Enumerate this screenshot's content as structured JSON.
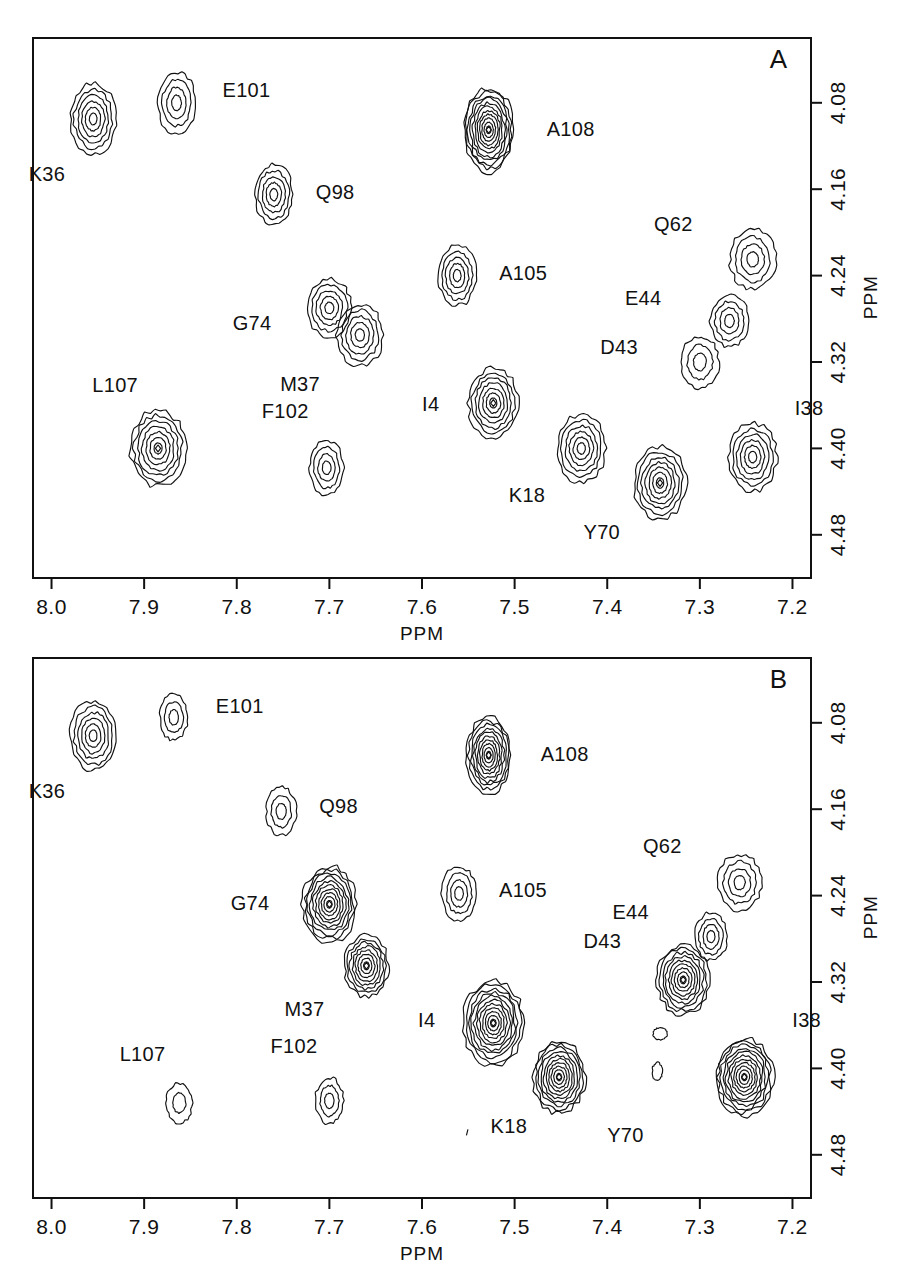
{
  "figure": {
    "caption": "",
    "panels": [
      {
        "id": "A",
        "letter": "A",
        "x_axis": {
          "label": "PPM",
          "ticks": [
            "8.0",
            "7.9",
            "7.8",
            "7.7",
            "7.6",
            "7.5",
            "7.4",
            "7.3",
            "7.2"
          ],
          "min": 7.2,
          "max": 8.0
        },
        "y_axis": {
          "label": "PPM",
          "ticks": [
            "4.08",
            "4.16",
            "4.24",
            "4.32",
            "4.40",
            "4.48"
          ],
          "min": 4.02,
          "max": 4.52
        }
      },
      {
        "id": "B",
        "letter": "B",
        "x_axis": {
          "label": "PPM",
          "ticks": [
            "8.0",
            "7.9",
            "7.8",
            "7.7",
            "7.6",
            "7.5",
            "7.4",
            "7.3",
            "7.2"
          ],
          "min": 7.2,
          "max": 8.0
        },
        "y_axis": {
          "label": "PPM",
          "ticks": [
            "4.08",
            "4.16",
            "4.24",
            "4.32",
            "4.40",
            "4.48"
          ],
          "min": 4.02,
          "max": 4.52
        }
      }
    ]
  },
  "chart_data": [
    {
      "type": "contour",
      "panel": "A",
      "title": "A",
      "xlabel": "PPM",
      "ylabel": "PPM",
      "xlim": [
        8.02,
        7.18
      ],
      "ylim": [
        4.02,
        4.52
      ],
      "xticks": [
        8.0,
        7.9,
        7.8,
        7.7,
        7.6,
        7.5,
        7.4,
        7.3,
        7.2
      ],
      "yticks": [
        4.08,
        4.16,
        4.24,
        4.32,
        4.4,
        4.48
      ],
      "grid": false,
      "legend": "none",
      "peaks": [
        {
          "label": "K36",
          "x": 7.955,
          "y": 4.095,
          "rx": 23,
          "ry": 35,
          "levels": 6,
          "label_dx": -28,
          "label_dy": 62,
          "intensity": "medium"
        },
        {
          "label": "E101",
          "x": 7.865,
          "y": 4.08,
          "rx": 19,
          "ry": 31,
          "levels": 4,
          "label_dx": 46,
          "label_dy": -6,
          "intensity": "low"
        },
        {
          "label": "A108",
          "x": 7.528,
          "y": 4.105,
          "rx": 25,
          "ry": 42,
          "levels": 11,
          "label_dx": 58,
          "label_dy": 6,
          "intensity": "very-high"
        },
        {
          "label": "Q98",
          "x": 7.76,
          "y": 4.165,
          "rx": 19,
          "ry": 30,
          "levels": 5,
          "label_dx": 42,
          "label_dy": 4,
          "intensity": "medium"
        },
        {
          "label": "Q62",
          "x": 7.243,
          "y": 4.225,
          "rx": 23,
          "ry": 30,
          "levels": 4,
          "label_dx": -60,
          "label_dy": -28,
          "intensity": "medium"
        },
        {
          "label": "A105",
          "x": 7.562,
          "y": 4.24,
          "rx": 19,
          "ry": 30,
          "levels": 5,
          "label_dx": 42,
          "label_dy": 4,
          "intensity": "medium"
        },
        {
          "label": "E44",
          "x": 7.268,
          "y": 4.282,
          "rx": 19,
          "ry": 26,
          "levels": 4,
          "label_dx": -68,
          "label_dy": -16,
          "intensity": "medium"
        },
        {
          "label": "G74",
          "x": 7.7,
          "y": 4.27,
          "rx": 22,
          "ry": 29,
          "levels": 5,
          "label_dx": -58,
          "label_dy": 22,
          "intensity": "medium"
        },
        {
          "label": "M37",
          "x": 7.667,
          "y": 4.295,
          "rx": 23,
          "ry": 31,
          "levels": 5,
          "label_dx": -40,
          "label_dy": 56,
          "intensity": "medium"
        },
        {
          "label": "D43",
          "x": 7.3,
          "y": 4.32,
          "rx": 19,
          "ry": 26,
          "levels": 3,
          "label_dx": -62,
          "label_dy": -8,
          "intensity": "low"
        },
        {
          "label": "I4",
          "x": 7.523,
          "y": 4.358,
          "rx": 25,
          "ry": 35,
          "levels": 7,
          "label_dx": -54,
          "label_dy": 8,
          "intensity": "high"
        },
        {
          "label": "L107",
          "x": 7.885,
          "y": 4.4,
          "rx": 28,
          "ry": 38,
          "levels": 7,
          "label_dx": -20,
          "label_dy": -56,
          "intensity": "high"
        },
        {
          "label": "F102",
          "x": 7.703,
          "y": 4.418,
          "rx": 17,
          "ry": 27,
          "levels": 4,
          "label_dx": -18,
          "label_dy": -50,
          "intensity": "low"
        },
        {
          "label": "K18",
          "x": 7.428,
          "y": 4.4,
          "rx": 24,
          "ry": 34,
          "levels": 6,
          "label_dx": -36,
          "label_dy": 54,
          "intensity": "medium"
        },
        {
          "label": "I38",
          "x": 7.243,
          "y": 4.408,
          "rx": 24,
          "ry": 34,
          "levels": 6,
          "label_dx": 42,
          "label_dy": -42,
          "intensity": "medium"
        },
        {
          "label": "Y70",
          "x": 7.343,
          "y": 4.432,
          "rx": 26,
          "ry": 36,
          "levels": 7,
          "label_dx": -40,
          "label_dy": 56,
          "intensity": "high"
        }
      ]
    },
    {
      "type": "contour",
      "panel": "B",
      "title": "B",
      "xlabel": "PPM",
      "ylabel": "PPM",
      "xlim": [
        8.02,
        7.18
      ],
      "ylim": [
        4.02,
        4.52
      ],
      "xticks": [
        8.0,
        7.9,
        7.8,
        7.7,
        7.6,
        7.5,
        7.4,
        7.3,
        7.2
      ],
      "yticks": [
        4.08,
        4.16,
        4.24,
        4.32,
        4.4,
        4.48
      ],
      "grid": false,
      "legend": "none",
      "peaks": [
        {
          "label": "K36",
          "x": 7.955,
          "y": 4.092,
          "rx": 23,
          "ry": 35,
          "levels": 6,
          "label_dx": -28,
          "label_dy": 62,
          "intensity": "medium"
        },
        {
          "label": "E101",
          "x": 7.868,
          "y": 4.075,
          "rx": 14,
          "ry": 23,
          "levels": 3,
          "label_dx": 42,
          "label_dy": -4,
          "intensity": "low"
        },
        {
          "label": "A108",
          "x": 7.528,
          "y": 4.11,
          "rx": 22,
          "ry": 38,
          "levels": 10,
          "label_dx": 52,
          "label_dy": 6,
          "intensity": "very-high"
        },
        {
          "label": "Q98",
          "x": 7.752,
          "y": 4.162,
          "rx": 15,
          "ry": 24,
          "levels": 3,
          "label_dx": 38,
          "label_dy": 2,
          "intensity": "low"
        },
        {
          "label": "Q62",
          "x": 7.257,
          "y": 4.228,
          "rx": 22,
          "ry": 28,
          "levels": 4,
          "label_dx": -58,
          "label_dy": -30,
          "intensity": "medium"
        },
        {
          "label": "A105",
          "x": 7.56,
          "y": 4.238,
          "rx": 17,
          "ry": 27,
          "levels": 4,
          "label_dx": 40,
          "label_dy": 4,
          "intensity": "low"
        },
        {
          "label": "E44",
          "x": 7.288,
          "y": 4.278,
          "rx": 16,
          "ry": 24,
          "levels": 4,
          "label_dx": -62,
          "label_dy": -18,
          "intensity": "medium"
        },
        {
          "label": "G74",
          "x": 7.7,
          "y": 4.248,
          "rx": 27,
          "ry": 38,
          "levels": 10,
          "label_dx": -60,
          "label_dy": 6,
          "intensity": "very-high"
        },
        {
          "label": "M37",
          "x": 7.66,
          "y": 4.305,
          "rx": 22,
          "ry": 31,
          "levels": 8,
          "label_dx": -42,
          "label_dy": 50,
          "intensity": "high"
        },
        {
          "label": "D43",
          "x": 7.318,
          "y": 4.318,
          "rx": 26,
          "ry": 35,
          "levels": 9,
          "label_dx": -62,
          "label_dy": -32,
          "intensity": "very-high"
        },
        {
          "label": "I4",
          "x": 7.523,
          "y": 4.358,
          "rx": 30,
          "ry": 42,
          "levels": 11,
          "label_dx": -58,
          "label_dy": 4,
          "intensity": "very-high"
        },
        {
          "label": "L107",
          "x": 7.862,
          "y": 4.432,
          "rx": 13,
          "ry": 20,
          "levels": 2,
          "label_dx": -14,
          "label_dy": -42,
          "intensity": "very-low"
        },
        {
          "label": "F102",
          "x": 7.7,
          "y": 4.43,
          "rx": 14,
          "ry": 23,
          "levels": 3,
          "label_dx": -12,
          "label_dy": -48,
          "intensity": "low"
        },
        {
          "label": "K18",
          "x": 7.452,
          "y": 4.408,
          "rx": 26,
          "ry": 36,
          "levels": 10,
          "label_dx": -32,
          "label_dy": 56,
          "intensity": "very-high"
        },
        {
          "label": "I38",
          "x": 7.252,
          "y": 4.408,
          "rx": 29,
          "ry": 39,
          "levels": 11,
          "label_dx": 48,
          "label_dy": -50,
          "intensity": "very-high"
        },
        {
          "label": "Y70",
          "x": 7.4,
          "y": 4.468,
          "rx": 0,
          "ry": 0,
          "levels": 0,
          "label_dx": 0,
          "label_dy": 0,
          "intensity": "label-only"
        }
      ]
    }
  ]
}
